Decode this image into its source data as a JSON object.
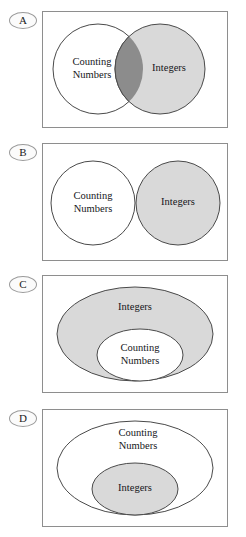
{
  "figure": {
    "type": "multiple-choice-venn-diagram",
    "width": 246,
    "height": 537,
    "label_counting_numbers_line1": "Counting",
    "label_counting_numbers_line2": "Numbers",
    "label_integers": "Integers",
    "colors": {
      "gray_fill": "#d9d9d9",
      "overlap_fill": "#8c8c8c",
      "white_fill": "#ffffff",
      "outline": "#4a4a4a",
      "panel_border": "#8e8e8e",
      "text": "#15161a"
    }
  },
  "options": [
    {
      "id": "A",
      "badge_letter": "A",
      "panel": {
        "top": 11,
        "height": 117
      },
      "relationship": "overlapping",
      "shapes": [
        {
          "name": "counting-numbers-circle",
          "kind": "circle",
          "cx": 56,
          "cy": 58,
          "r": 45,
          "fill": "#ffffff",
          "label": [
            "Counting",
            "Numbers"
          ],
          "label_x": 50,
          "label_y": 58
        },
        {
          "name": "integers-circle",
          "kind": "circle",
          "cx": 118,
          "cy": 58,
          "r": 45,
          "fill": "#d9d9d9",
          "label": [
            "Integers"
          ],
          "label_x": 127,
          "label_y": 58
        }
      ]
    },
    {
      "id": "B",
      "badge_letter": "B",
      "panel": {
        "top": 143,
        "height": 118
      },
      "relationship": "disjoint",
      "shapes": [
        {
          "name": "counting-numbers-circle",
          "kind": "circle",
          "cx": 51,
          "cy": 60,
          "r": 42,
          "fill": "#ffffff",
          "label": [
            "Counting",
            "Numbers"
          ],
          "label_x": 51,
          "label_y": 60
        },
        {
          "name": "integers-circle",
          "kind": "circle",
          "cx": 136,
          "cy": 60,
          "r": 42,
          "fill": "#d9d9d9",
          "label": [
            "Integers"
          ],
          "label_x": 136,
          "label_y": 60
        }
      ]
    },
    {
      "id": "C",
      "badge_letter": "C",
      "panel": {
        "top": 275,
        "height": 118
      },
      "relationship": "counting-numbers-inside-integers",
      "shapes": [
        {
          "name": "integers-ellipse",
          "kind": "ellipse",
          "cx": 93,
          "cy": 59,
          "rx": 78,
          "ry": 47,
          "fill": "#d9d9d9",
          "label": [
            "Integers"
          ],
          "label_x": 93,
          "label_y": 33
        },
        {
          "name": "counting-numbers-ellipse",
          "kind": "ellipse",
          "cx": 98,
          "cy": 80,
          "rx": 43,
          "ry": 26,
          "fill": "#ffffff",
          "label": [
            "Counting",
            "Numbers"
          ],
          "label_x": 98,
          "label_y": 80
        }
      ]
    },
    {
      "id": "D",
      "badge_letter": "D",
      "panel": {
        "top": 409,
        "height": 118
      },
      "relationship": "integers-inside-counting-numbers",
      "shapes": [
        {
          "name": "counting-numbers-ellipse",
          "kind": "ellipse",
          "cx": 93,
          "cy": 59,
          "rx": 78,
          "ry": 47,
          "fill": "#ffffff",
          "label": [
            "Counting",
            "Numbers"
          ],
          "label_x": 96,
          "label_y": 31
        },
        {
          "name": "integers-ellipse",
          "kind": "ellipse",
          "cx": 93,
          "cy": 80,
          "rx": 43,
          "ry": 26,
          "fill": "#d9d9d9",
          "label": [
            "Integers"
          ],
          "label_x": 93,
          "label_y": 80
        }
      ]
    }
  ]
}
